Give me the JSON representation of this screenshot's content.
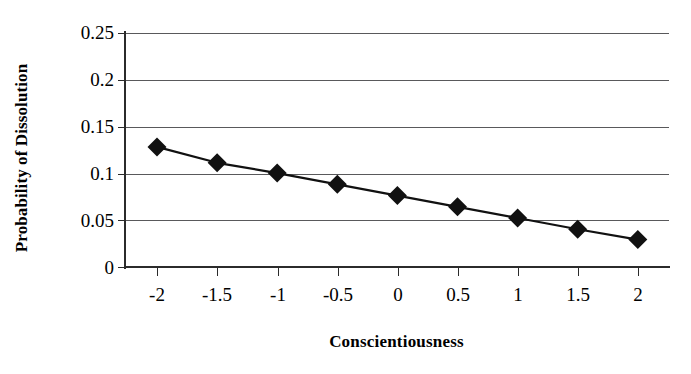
{
  "chart_data": {
    "type": "line",
    "title": "",
    "subtitle": "",
    "xlabel": "Conscientiousness",
    "ylabel": "Probability of Dissolution",
    "x": [
      -2,
      -1.5,
      -1,
      -0.5,
      0,
      0.5,
      1,
      1.5,
      2
    ],
    "values": [
      0.128,
      0.111,
      0.1,
      0.088,
      0.076,
      0.064,
      0.052,
      0.04,
      0.029
    ],
    "series": [
      {
        "name": "Probability of Dissolution",
        "values": [
          0.128,
          0.111,
          0.1,
          0.088,
          0.076,
          0.064,
          0.052,
          0.04,
          0.029
        ]
      }
    ],
    "xlim": [
      -2.2,
      2.2
    ],
    "ylim": [
      0,
      0.25
    ],
    "xticks": [
      -2,
      -1.5,
      -1,
      -0.5,
      0,
      0.5,
      1,
      1.5,
      2
    ],
    "xtick_labels": [
      "-2",
      "-1.5",
      "-1",
      "-0.5",
      "0",
      "0.5",
      "1",
      "1.5",
      "2"
    ],
    "yticks": [
      0,
      0.05,
      0.1,
      0.15,
      0.2,
      0.25
    ],
    "ytick_labels": [
      "0",
      "0.05",
      "0.1",
      "0.15",
      "0.2",
      "0.25"
    ],
    "grid": "horizontal",
    "legend": "none",
    "marker": "diamond",
    "line_color": "#111111",
    "marker_color": "#111111",
    "grid_color": "#59595b",
    "axis_color": "#2b2b2b",
    "background": "#ffffff"
  }
}
